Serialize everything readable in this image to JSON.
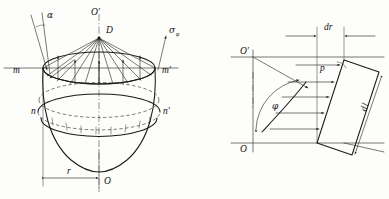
{
  "figure": {
    "panels": [
      {
        "id": "left",
        "name": "paraboloid-vessel-panel",
        "description": "Axisymmetric paraboloid bowl with apex D, rim m-m', intermediate ring n-n', radius r and axis O'-O",
        "labels": {
          "alpha": "α",
          "apex_top": "O′",
          "apex_point": "D",
          "sigma_phi": "σ",
          "sigma_phi_sub": "φ",
          "rim_left": "m",
          "rim_right": "m′",
          "ring_left": "n",
          "ring_right": "n′",
          "radius": "r",
          "origin": "O"
        }
      },
      {
        "id": "right",
        "name": "element-force-panel",
        "description": "Meridional element of width dr and length dl inclined at angle phi with pressure p acting normal to it",
        "labels": {
          "top_origin": "O′",
          "bottom_origin": "O",
          "element_width": "dr",
          "element_length": "d",
          "element_length_prime": "l",
          "pressure": "p",
          "angle": "φ"
        }
      }
    ],
    "colors": {
      "ink": "#1a1a1a",
      "thin_ink": "#2a2a2a",
      "paper": "#fdfdfb"
    }
  }
}
